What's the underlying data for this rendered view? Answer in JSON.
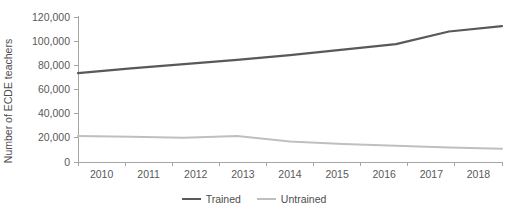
{
  "chart_data": {
    "type": "line",
    "title": "",
    "subtitle": "",
    "xlabel": "",
    "ylabel": "Number of ECDE teachers",
    "x": [
      2010,
      2011,
      2012,
      2013,
      2014,
      2015,
      2016,
      2017,
      2018
    ],
    "categories": [
      "2010",
      "2011",
      "2012",
      "2013",
      "2014",
      "2015",
      "2016",
      "2017",
      "2018"
    ],
    "series": [
      {
        "name": "Trained",
        "color": "#595959",
        "stroke_width": 2.2,
        "values": [
          73500,
          77500,
          81000,
          84500,
          88500,
          93000,
          97500,
          108000,
          112500
        ]
      },
      {
        "name": "Untrained",
        "color": "#bfbfbf",
        "stroke_width": 2.0,
        "values": [
          21500,
          21000,
          20000,
          21500,
          17000,
          15000,
          13500,
          12000,
          11000
        ]
      }
    ],
    "ylim": [
      0,
      120000
    ],
    "ytick_values": [
      0,
      20000,
      40000,
      60000,
      80000,
      100000,
      120000
    ],
    "ytick_labels": [
      "0",
      "20,000",
      "40,000",
      "60,000",
      "80,000",
      "100,000",
      "120,000"
    ],
    "xlim": [
      2010,
      2018
    ],
    "grid": false,
    "legend_position": "bottom-center",
    "legend_entries": [
      "Trained",
      "Untrained"
    ],
    "annotations": []
  },
  "legend": {
    "items": [
      {
        "label": "Trained"
      },
      {
        "label": "Untrained"
      }
    ]
  },
  "axes": {
    "y_title": "Number of ECDE teachers"
  }
}
